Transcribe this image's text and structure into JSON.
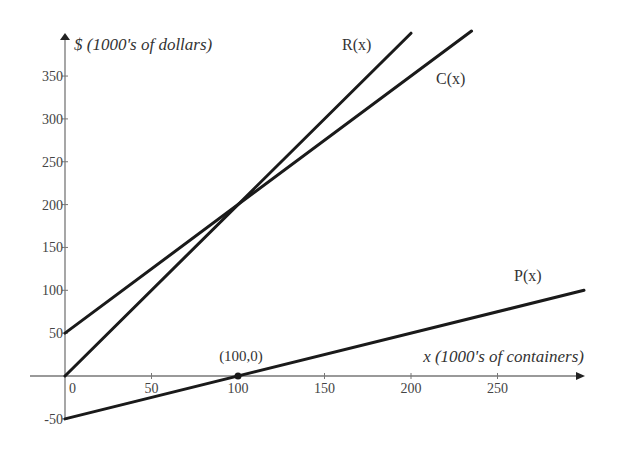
{
  "chart_data": {
    "type": "line",
    "title": "",
    "xlabel": "x (1000's of containers)",
    "ylabel": "$ (1000's of dollars)",
    "xlim": [
      -20,
      300
    ],
    "ylim": [
      -70,
      390
    ],
    "grid": false,
    "legend": "inline labels",
    "x_ticks": [
      0,
      50,
      100,
      150,
      200,
      250
    ],
    "x_tick_labels": [
      "0",
      "50",
      "100",
      "150",
      "200",
      "250"
    ],
    "y_ticks": [
      -50,
      50,
      100,
      150,
      200,
      250,
      300,
      350
    ],
    "y_tick_labels": [
      "-50",
      "50",
      "100",
      "150",
      "200",
      "250",
      "300",
      "350"
    ],
    "series": [
      {
        "name": "R(x)",
        "label": "R(x)",
        "x": [
          0,
          200
        ],
        "values": [
          0,
          400
        ],
        "slope": 2,
        "intercept": 0,
        "x_end": 200
      },
      {
        "name": "C(x)",
        "label": "C(x)",
        "x": [
          0,
          235
        ],
        "values": [
          50,
          402.5
        ],
        "slope": 1.5,
        "intercept": 50,
        "x_end": 235
      },
      {
        "name": "P(x)",
        "label": "P(x)",
        "x": [
          0,
          300
        ],
        "values": [
          -50,
          100
        ],
        "slope": 0.5,
        "intercept": -50,
        "x_end": 300
      }
    ],
    "annotations": [
      {
        "text": "(100,0)",
        "x": 100,
        "y": 0,
        "marker": "point"
      }
    ]
  }
}
